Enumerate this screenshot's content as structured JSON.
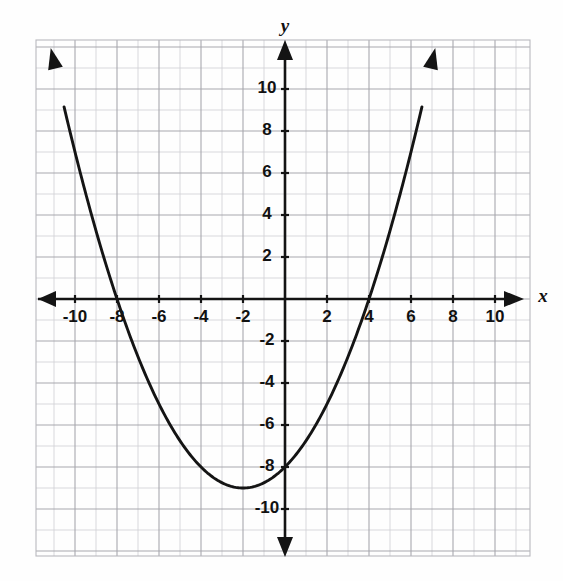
{
  "figure": {
    "kind": "coordinate-plane-graph",
    "background_color": "#fefefe",
    "ink_color": "#141414",
    "grid_minor_color": "#cfcfd4",
    "grid_major_color": "#a8a8ae"
  },
  "axes": {
    "x_axis_label": "x",
    "y_axis_label": "y",
    "x_tick_labels": [
      "-10",
      "-8",
      "-6",
      "-4",
      "-2",
      "2",
      "4",
      "6",
      "8",
      "10"
    ],
    "y_tick_labels": [
      "10",
      "8",
      "6",
      "4",
      "2",
      "-2",
      "-4",
      "-6",
      "-8",
      "-10"
    ]
  },
  "chart_data": {
    "type": "line",
    "title": "",
    "xlabel": "x",
    "ylabel": "y",
    "xlim": [
      -11.85,
      11.65
    ],
    "ylim": [
      -11.95,
      11.95
    ],
    "grid": true,
    "grid_step": 1,
    "major_grid_step": 2,
    "legend": "none",
    "x_ticks": [
      -10,
      -8,
      -6,
      -4,
      -2,
      2,
      4,
      6,
      8,
      10
    ],
    "y_ticks": [
      10,
      8,
      6,
      4,
      2,
      -2,
      -4,
      -6,
      -8,
      -10
    ],
    "series": [
      {
        "name": "parabola",
        "kind": "quadratic",
        "equation": "y = 0.25x^2 + x - 8",
        "vertex": [
          -2,
          -9
        ],
        "x_intercepts": [
          -8,
          4
        ],
        "y_intercept": -8,
        "axis_of_symmetry": -2,
        "opens": "up",
        "leading_coefficient": 0.25,
        "arrowheads": [
          "start",
          "end"
        ],
        "x": [
          -9.9,
          -9.5,
          -9,
          -8.5,
          -8,
          -7.5,
          -7,
          -6.5,
          -6,
          -5.5,
          -5,
          -4.5,
          -4,
          -3.5,
          -3,
          -2.5,
          -2,
          -1.5,
          -1,
          -0.5,
          0,
          0.5,
          1,
          1.5,
          2,
          2.5,
          3,
          3.5,
          4,
          4.5,
          5,
          5.5,
          5.9
        ],
        "y": [
          6.6,
          4.06,
          2.25,
          0.56,
          -1,
          -2.44,
          -2.75,
          -3.94,
          -5,
          -5.94,
          -6.75,
          -7.44,
          -8,
          -8.44,
          -8.75,
          -8.94,
          -9,
          -8.94,
          -8.75,
          -8.44,
          -8,
          -7.44,
          -6.75,
          -5.94,
          -5,
          -3.94,
          -2.75,
          -1.44,
          0,
          1.56,
          3.25,
          5.06,
          6.6
        ]
      }
    ]
  }
}
